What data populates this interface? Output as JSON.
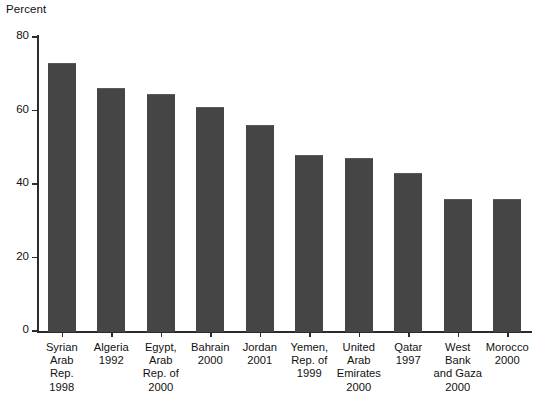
{
  "chart": {
    "type": "bar",
    "ylabel": "Percent"
  },
  "chart_data": {
    "type": "bar",
    "title": "",
    "subtitle": "",
    "xlabel": "",
    "ylabel": "Percent",
    "ylim": [
      0,
      80
    ],
    "yticks": [
      0,
      20,
      40,
      60,
      80
    ],
    "grid": false,
    "legend": null,
    "bar_color": "#454545",
    "categories": [
      "Syrian\nArab Rep.\n1998",
      "Algeria\n1992",
      "Egypt,\nArab\nRep. of\n2000",
      "Bahrain\n2000",
      "Jordan\n2001",
      "Yemen,\nRep. of\n1999",
      "United\nArab\nEmirates\n2000",
      "Qatar\n1997",
      "West\nBank\nand Gaza\n2000",
      "Morocco\n2000"
    ],
    "values": [
      73,
      66,
      64.5,
      61,
      56,
      48,
      47,
      43,
      36,
      36
    ]
  }
}
